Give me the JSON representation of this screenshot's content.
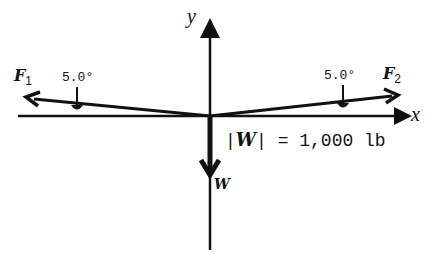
{
  "diagram": {
    "axes": {
      "x_label": "x",
      "y_label": "y"
    },
    "forces": [
      {
        "name": "F",
        "subscript": "1",
        "angle_label": "5.0°",
        "direction": "left, 5.0° above x-axis"
      },
      {
        "name": "F",
        "subscript": "2",
        "angle_label": "5.0°",
        "direction": "right, 5.0° above x-axis"
      },
      {
        "name": "W",
        "direction": "down"
      }
    ],
    "weight": {
      "magnitude_text": "= 1,000 lb",
      "symbol": "W"
    },
    "colors": {
      "stroke": "#111111",
      "background": "#ffffff"
    }
  }
}
